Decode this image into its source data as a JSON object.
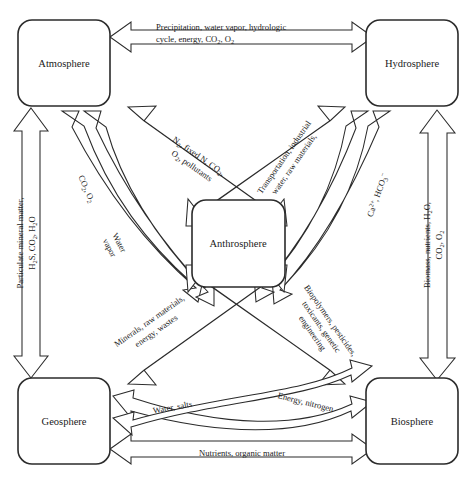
{
  "diagram": {
    "type": "block-arrow flow diagram",
    "stroke_color": "#2b2b2b",
    "fill_color": "#ffffff",
    "background": "#ffffff"
  },
  "nodes": {
    "atmosphere": "Atmosphere",
    "hydrosphere": "Hydrosphere",
    "geosphere": "Geosphere",
    "biosphere": "Biosphere",
    "anthrosphere": "Anthrosphere"
  },
  "flows": {
    "atmosphere_hydrosphere": {
      "line1": "Precipitation, water vapor, hydrologic",
      "line2_a": "cycle, energy, CO",
      "line2_sub1": "2",
      "line2_b": ", O",
      "line2_sub2": "2"
    },
    "atmosphere_geosphere": {
      "line1_a": "Particulate mineral matter,",
      "line2_a": "H",
      "line2_sub1": "2",
      "line2_b": "S, CO",
      "line2_sub2": "2",
      "line2_c": ", H",
      "line2_sub3": "2",
      "line2_d": "O"
    },
    "atmosphere_anthrosphere_out": {
      "line1_a": "N",
      "line1_sub1": "2",
      "line1_b": ", fixed N, CO",
      "line1_sub2": "2",
      "line1_c": ",",
      "line2_a": "O",
      "line2_sub1": "2",
      "line2_b": ", pollutants"
    },
    "anthrosphere_atmosphere_co2o2": {
      "text_a": "CO",
      "sub1": "2",
      "text_b": ", O",
      "sub2": "2"
    },
    "anthrosphere_atmosphere_watervapor": {
      "line1": "Water",
      "line2": "vapor"
    },
    "hydrosphere_anthrosphere": {
      "line1": "Transportation, industrial",
      "line2": "water, raw materials,"
    },
    "anthrosphere_hydrosphere_ions": {
      "text_a": "Ca",
      "sup1": "2+",
      "text_b": ", HCO",
      "sub1": "3",
      "sup2": "−"
    },
    "hydrosphere_biosphere": {
      "line1_a": "Biomass, nutrients, H",
      "line1_sub1": "2",
      "line1_b": "O,",
      "line2_a": "CO",
      "line2_sub1": "2",
      "line2_b": ", O",
      "line2_sub2": "2"
    },
    "geosphere_anthrosphere": {
      "line1": "Minerals, raw materials,",
      "line2": "energy, wastes"
    },
    "anthrosphere_biosphere": {
      "line1": "Biopolymers, pesticides,",
      "line2": "toxicants, genetic",
      "line3": "engineering"
    },
    "geosphere_biosphere_upper": {
      "text": "Water, salts"
    },
    "geosphere_biosphere_cross": {
      "text": "Energy, nitrogen"
    },
    "geosphere_biosphere_lower": {
      "text": "Nutrients, organic matter"
    }
  }
}
